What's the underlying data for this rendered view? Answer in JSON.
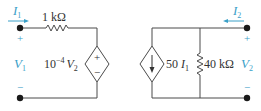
{
  "colors": {
    "wire": "#4a4a4a",
    "label": "#3aa0c8",
    "text": "#333333",
    "background": "#ffffff"
  },
  "left_circuit": {
    "input_current": {
      "symbol": "I",
      "subscript": "1"
    },
    "series_resistor": {
      "value": "1 kΩ"
    },
    "input_voltage": {
      "symbol": "V",
      "subscript": "1",
      "plus": "+",
      "minus": "−"
    },
    "dependent_voltage_source": {
      "type": "voltage-controlled voltage source",
      "gain": "10",
      "exponent": "−4",
      "control": "V",
      "control_subscript": "2",
      "plus": "+",
      "minus": "−"
    }
  },
  "right_circuit": {
    "output_current": {
      "symbol": "I",
      "subscript": "2"
    },
    "dependent_current_source": {
      "type": "current-controlled current source",
      "gain": "50",
      "control": "I",
      "control_subscript": "1"
    },
    "shunt_resistor": {
      "value": "40 kΩ"
    },
    "output_voltage": {
      "symbol": "V",
      "subscript": "2",
      "plus": "+",
      "minus": "−"
    }
  }
}
